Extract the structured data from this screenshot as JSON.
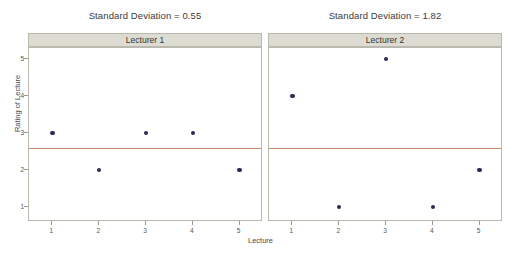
{
  "chart_data": {
    "type": "scatter",
    "title": "",
    "xlabel": "Lecture",
    "ylabel": "Rating of Lecture",
    "xlim": [
      0.5,
      5.5
    ],
    "ylim": [
      0.6,
      5.3
    ],
    "grid": false,
    "legend": "none",
    "x_ticks": [
      "1",
      "2",
      "3",
      "4",
      "5"
    ],
    "y_ticks": [
      "1",
      "2",
      "3",
      "4",
      "5"
    ],
    "marker_color": "#2a2a55",
    "reference_line_color": "#c98d72",
    "strip_background": "#dcdcd2",
    "panels": [
      {
        "strip_label": "Lecturer 1",
        "panel_title": "Standard Deviation = 0.55",
        "x": [
          1,
          2,
          3,
          4,
          5
        ],
        "values": [
          3,
          2,
          3,
          3,
          2
        ],
        "reference_line": 2.6
      },
      {
        "strip_label": "Lecturer 2",
        "panel_title": "Standard Deviation = 1.82",
        "x": [
          1,
          2,
          3,
          4,
          5
        ],
        "values": [
          4,
          1,
          5,
          1,
          2
        ],
        "reference_line": 2.6
      }
    ]
  }
}
